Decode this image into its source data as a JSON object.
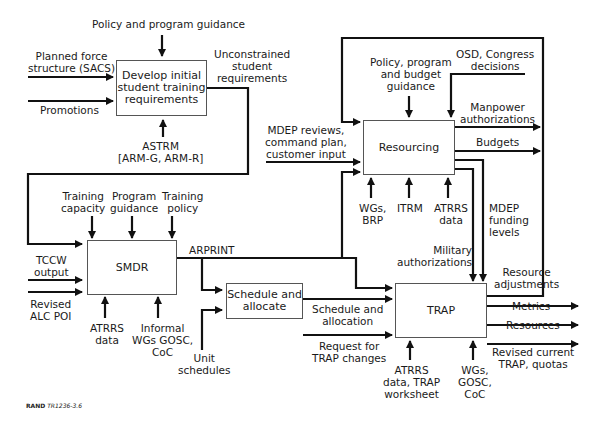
{
  "boxes": {
    "develop": "Develop initial\nstudent training\nrequirements",
    "resourcing": "Resourcing",
    "smdr": "SMDR",
    "schedule": "Schedule and\nallocate",
    "trap": "TRAP"
  },
  "labels": {
    "policy_program_guidance": "Policy and program guidance",
    "planned_force": "Planned force\nstructure (SACS)",
    "promotions": "Promotions",
    "unconstrained": "Unconstrained\nstudent\nrequirements",
    "astrm": "ASTRM\n[ARM-G, ARM-R]",
    "policy_program_budget": "Policy, program\nand budget\nguidance",
    "osd_congress": "OSD, Congress\ndecisions",
    "manpower_auth": "Manpower\nauthorizations",
    "budgets": "Budgets",
    "mdep_reviews": "MDEP reviews,\ncommand plan,\ncustomer input",
    "wgs_brp": "WGs,\nBRP",
    "itrm": "ITRM",
    "atrrs_data_res": "ATRRS\ndata",
    "mdep_funding": "MDEP\nfunding\nlevels",
    "military_auth": "Military\nauthorizations",
    "training_capacity": "Training\ncapacity",
    "program_guidance": "Program\nguidance",
    "training_policy": "Training\npolicy",
    "tccw_output": "TCCW\noutput",
    "revised_alc": "Revised\nALC POI",
    "atrrs_data_smdr": "ATRRS\ndata",
    "informal_wgs": "Informal\nWGs GOSC,\nCoC",
    "arprint": "ARPRINT",
    "unit_schedules": "Unit\nschedules",
    "schedule_allocation": "Schedule and\nallocation",
    "request_trap": "Request for\nTRAP changes",
    "atrrs_trap": "ATRRS\ndata, TRAP\nworksheet",
    "wgs_gosc_coc": "WGs,\nGOSC,\nCoC",
    "resource_adjustments": "Resource\nadjustments",
    "metrics": "Metrics",
    "resources": "Resources",
    "revised_current_trap": "Revised current\nTRAP, quotas"
  },
  "footer": {
    "org": "RAND",
    "id": "TR1236-3.6"
  }
}
